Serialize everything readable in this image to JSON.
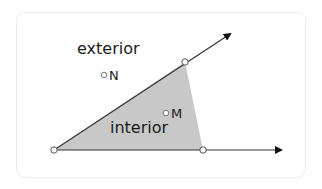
{
  "diagram": {
    "labels": {
      "exterior": "exterior",
      "interior": "interior",
      "point_N": "N",
      "point_M": "M"
    },
    "colors": {
      "background": "#ffffff",
      "card_border": "#ececec",
      "line": "#333333",
      "arrow": "#111111",
      "interior_fill": "#c8c8c8",
      "point_fill": "#ffffff",
      "point_stroke": "#555555",
      "text": "#1a1a1a"
    },
    "geometry": {
      "vertex": [
        54,
        150
      ],
      "upper_ray_point": [
        185,
        62
      ],
      "upper_ray_end": [
        231,
        33
      ],
      "lower_ray_point": [
        203,
        150
      ],
      "lower_ray_end": [
        282,
        150
      ],
      "point_N": [
        104,
        75
      ],
      "point_M": [
        166,
        113
      ]
    }
  }
}
